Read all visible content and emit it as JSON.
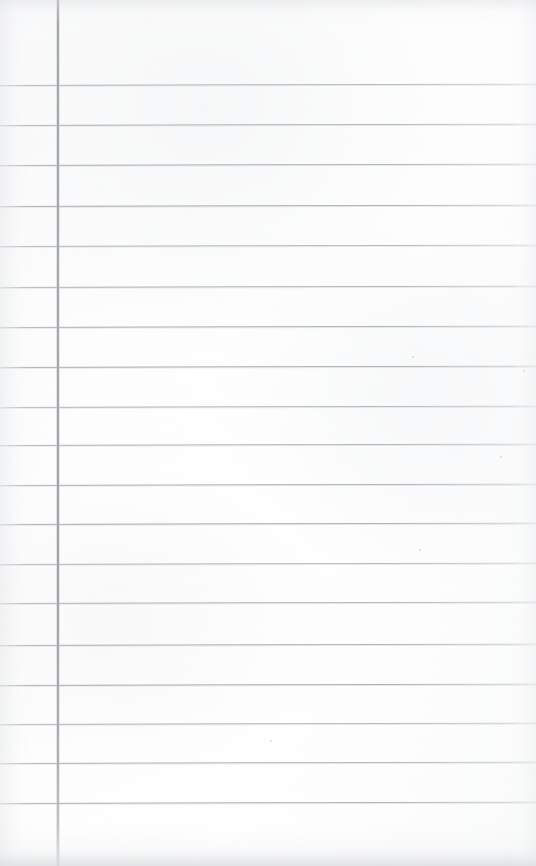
{
  "document": {
    "kind": "scanned-blank-ruled-notebook-page",
    "title": "Blank Ruled Notebook Page",
    "written_text": "",
    "page_width": 536,
    "page_height": 866,
    "orientation": "portrait"
  },
  "paper": {
    "background_color": "#fdfdfd",
    "tint_color": "#fbfbfc",
    "texture": "faint-paper-grain",
    "edge_shadow_color": "#dee0e3"
  },
  "ruling": {
    "style": "wide-ruled-with-left-margin",
    "rule_color": "#a3a8af",
    "rule_thickness_px": 1,
    "rule_spacing_px": 40,
    "rule_count": 19,
    "rule_positions_y": [
      85,
      125,
      165,
      206,
      246,
      287,
      327,
      367,
      407,
      445,
      485,
      524,
      564,
      603,
      645,
      685,
      724,
      763,
      803
    ],
    "rule_left_x": 0,
    "rule_right_x": 536,
    "skew_degrees": -0.15
  },
  "margin_rule": {
    "orientation": "vertical",
    "color": "#9aa0a7",
    "thickness_px": 2,
    "x_position": 57,
    "top_y": 0,
    "bottom_y": 866
  },
  "margin_column": {
    "label": "left-margin-column",
    "width_px": 57,
    "content": ""
  },
  "writing_area": {
    "label": "writing-area",
    "left_x": 57,
    "width_px": 479,
    "content": ""
  },
  "specks": [
    {
      "x": 412,
      "y": 356,
      "size": 2
    },
    {
      "x": 523,
      "y": 370,
      "size": 2
    },
    {
      "x": 500,
      "y": 456,
      "size": 2
    },
    {
      "x": 419,
      "y": 549,
      "size": 2
    },
    {
      "x": 270,
      "y": 740,
      "size": 2
    }
  ]
}
